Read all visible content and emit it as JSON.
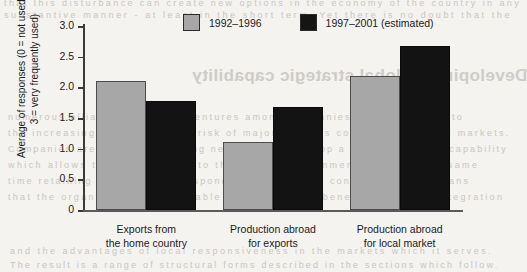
{
  "page_bleed_text": {
    "line1": "that  this disturbance  can  create  new  options  in  the  economy  of  the  country  in  any",
    "line2": "substantive  manner  -  at  least  in  the  short  term.  Yet  there  is  no  doubt  that  the",
    "heading_mirrored": "Developing a global strategic capability",
    "body1": "numerous  alliances  and  joint  ventures  among  companies  are  a  response  to",
    "body2": "the  increasing  complexity  and  risk  of  major  projects  competing  in  world  markets.",
    "body3": "Companies  are  therefore  seeking  new  ways  to  develop  a  global  strategic  capability",
    "body4": "which  allows  them  to  respond  to  the  global  environment  whilst  at  the  same",
    "body5": "time  retaining  the  ability  to  respond  to  local  market  conditions.  This  means",
    "body6": "that  the  organisation  must  be  able  to  combine  the  benefits  of  global  integration",
    "foot1": "and  the  advantages  of  local  responsiveness  in  the  markets  which  it  serves.",
    "foot2": "The  result  is  a  range  of  structural  forms  described  in  the  sections  which  follow."
  },
  "chart_data": {
    "type": "bar",
    "title": "",
    "xlabel": "",
    "ylabel": "Average of responses (0 = not used and 3 = very frequently used)",
    "ylim": [
      0,
      3.0
    ],
    "ytick_labels": [
      "3.0",
      "2.5",
      "2.0",
      "1.5",
      "1.0",
      "0.5",
      "0"
    ],
    "ytick_values": [
      3.0,
      2.5,
      2.0,
      1.5,
      1.0,
      0.5,
      0
    ],
    "grid": false,
    "legend_position": "top-center",
    "categories": [
      "Exports from\nthe home country",
      "Production abroad\nfor exports",
      "Production abroad\nfor local market"
    ],
    "category_lines": [
      [
        "Exports from",
        "the home country"
      ],
      [
        "Production abroad",
        "for exports"
      ],
      [
        "Production abroad",
        "for local market"
      ]
    ],
    "series": [
      {
        "name": "1992–1996",
        "color": "#a7a7a7",
        "values": [
          2.1,
          1.11,
          2.19
        ]
      },
      {
        "name": "1997–2001 (estimated)",
        "color": "#131313",
        "values": [
          1.77,
          1.68,
          2.68
        ]
      }
    ]
  },
  "legend": {
    "items": [
      {
        "label": "1992–1996",
        "swatch": "gray-swatch"
      },
      {
        "label": "1997–2001 (estimated)",
        "swatch": "black-swatch"
      }
    ]
  }
}
